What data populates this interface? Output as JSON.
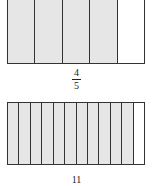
{
  "models": [
    {
      "name": "top",
      "parts": 5,
      "shaded": 4,
      "numerator": "4",
      "denominator": "5"
    },
    {
      "name": "bottom",
      "parts": 12,
      "shaded": 11,
      "numerator": "11",
      "denominator": ""
    }
  ],
  "colors": {
    "shaded": "#e6e6e6",
    "empty": "#ffffff",
    "line": "#333333"
  }
}
